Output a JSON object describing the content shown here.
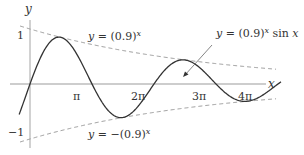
{
  "chart_data": {
    "type": "line",
    "title": "",
    "xlabel": "x",
    "ylabel": "y",
    "xlim": [
      0,
      12.57
    ],
    "ylim": [
      -1,
      1
    ],
    "grid": false,
    "x_ticks": [
      "π",
      "2π",
      "3π",
      "4π"
    ],
    "y_ticks": [
      "1",
      "−1"
    ],
    "series": [
      {
        "name": "y = (0.9)^x sin x",
        "style": "solid",
        "color": "#333333",
        "function": "0.9^x * sin(x)"
      },
      {
        "name": "y = (0.9)^x",
        "style": "dashed",
        "color": "#999999",
        "function": "0.9^x"
      },
      {
        "name": "y = −(0.9)^x",
        "style": "dashed",
        "color": "#999999",
        "function": "-(0.9^x)"
      }
    ],
    "annotations": [
      {
        "text": "y = (0.9)^x",
        "position": "upper-left"
      },
      {
        "text": "y = (0.9)^x sin x",
        "position": "upper-right",
        "arrow": true
      },
      {
        "text": "y = −(0.9)^x",
        "position": "lower-center"
      }
    ]
  },
  "labels": {
    "y_axis": "y",
    "x_axis": "x",
    "tick_1": "1",
    "tick_neg1": "−1",
    "tick_pi": "π",
    "tick_2pi": "2π",
    "tick_3pi": "3π",
    "tick_4pi": "4π",
    "upper_env_prefix": "y = (0.9)",
    "upper_env_exp": "x",
    "curve_prefix": "y = (0.9)",
    "curve_exp": "x",
    "curve_suffix": " sin x",
    "lower_env_prefix": "y = −(0.9)",
    "lower_env_exp": "x"
  },
  "colors": {
    "curve": "#333333",
    "envelope": "#9a9a9a",
    "axis": "#bbbbbb"
  }
}
